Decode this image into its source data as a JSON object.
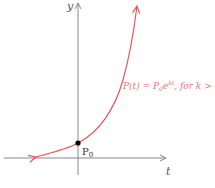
{
  "diagram": {
    "axes": {
      "x_label": "t",
      "y_label": "y"
    },
    "point": {
      "label": "P",
      "subscript": "0"
    },
    "curve_label": {
      "prefix": "P(t) = P",
      "sub": "0",
      "base": "e",
      "exp": "kt",
      "suffix": ", for k > 0"
    },
    "colors": {
      "axis": "#888888",
      "curve": "#e8555a",
      "label": "#e8707a",
      "point": "#000000"
    }
  }
}
